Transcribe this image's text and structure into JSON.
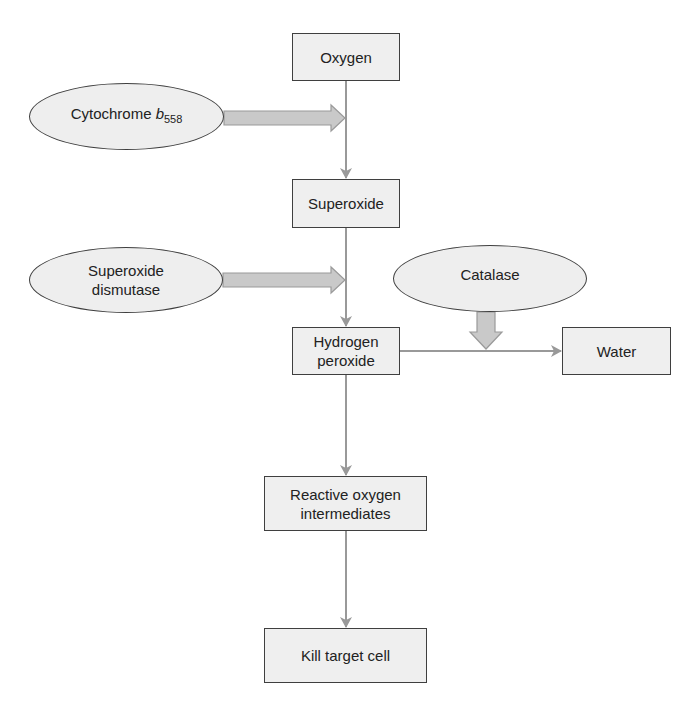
{
  "diagram": {
    "type": "flowchart",
    "colors": {
      "box_fill": "#efefef",
      "box_border": "#3f3f3f",
      "connector": "#999999",
      "fat_arrow_fill": "#c9c9c9",
      "fat_arrow_border": "#9a9a9a"
    },
    "nodes": {
      "oxygen": {
        "shape": "box",
        "label": "Oxygen"
      },
      "superoxide": {
        "shape": "box",
        "label": "Superoxide"
      },
      "hydrogen_peroxide": {
        "shape": "box",
        "line1": "Hydrogen",
        "line2": "peroxide"
      },
      "water": {
        "shape": "box",
        "label": "Water"
      },
      "roi": {
        "shape": "box",
        "line1": "Reactive oxygen",
        "line2": "intermediates"
      },
      "kill": {
        "shape": "box",
        "label": "Kill target cell"
      },
      "cytochrome": {
        "shape": "ellipse",
        "label_main": "Cytochrome ",
        "label_italic": "b",
        "label_sub": "558"
      },
      "sod": {
        "shape": "ellipse",
        "line1": "Superoxide",
        "line2": "dismutase"
      },
      "catalase": {
        "shape": "ellipse",
        "label": "Catalase"
      }
    },
    "edges": [
      {
        "from": "Oxygen",
        "to": "Superoxide",
        "catalyst": "Cytochrome b558"
      },
      {
        "from": "Superoxide",
        "to": "Hydrogen peroxide",
        "catalyst": "Superoxide dismutase"
      },
      {
        "from": "Hydrogen peroxide",
        "to": "Water",
        "catalyst": "Catalase"
      },
      {
        "from": "Hydrogen peroxide",
        "to": "Reactive oxygen intermediates"
      },
      {
        "from": "Reactive oxygen intermediates",
        "to": "Kill target cell"
      }
    ]
  }
}
